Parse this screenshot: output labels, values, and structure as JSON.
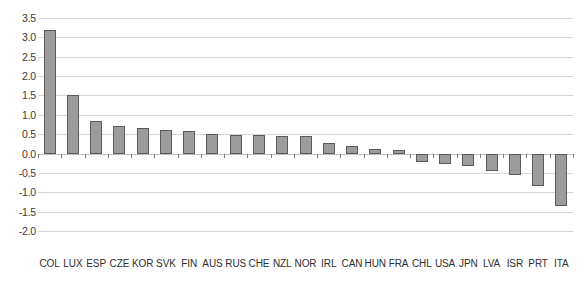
{
  "chart_data": {
    "type": "bar",
    "title": "",
    "subtitle": "",
    "xlabel": "",
    "ylabel": "",
    "ylim": [
      -2.0,
      3.5
    ],
    "ytick_labels": [
      "3.5",
      "3.0",
      "2.5",
      "2.0",
      "1.5",
      "1.0",
      "0.5",
      "0.0",
      "-0.5",
      "-1.0",
      "-1.5",
      "-2.0"
    ],
    "ytick_values": [
      3.5,
      3.0,
      2.5,
      2.0,
      1.5,
      1.0,
      0.5,
      0.0,
      -0.5,
      -1.0,
      -1.5,
      -2.0
    ],
    "grid": true,
    "legend": false,
    "legend_position": "none",
    "bar_color": "#9c9c9c",
    "bar_edge_color": "#5a5a5a",
    "grid_color": "#d6d6d6",
    "categories": [
      "COL",
      "LUX",
      "ESP",
      "CZE",
      "KOR",
      "SVK",
      "FIN",
      "AUS",
      "RUS",
      "CHE",
      "NZL",
      "NOR",
      "IRL",
      "CAN",
      "HUN",
      "FRA",
      "CHL",
      "USA",
      "JPN",
      "LVA",
      "ISR",
      "PRT",
      "ITA"
    ],
    "values": [
      3.2,
      1.52,
      0.85,
      0.72,
      0.67,
      0.62,
      0.58,
      0.5,
      0.48,
      0.47,
      0.46,
      0.45,
      0.28,
      0.2,
      0.12,
      0.1,
      -0.22,
      -0.26,
      -0.33,
      -0.45,
      -0.55,
      -0.85,
      -1.35
    ]
  }
}
